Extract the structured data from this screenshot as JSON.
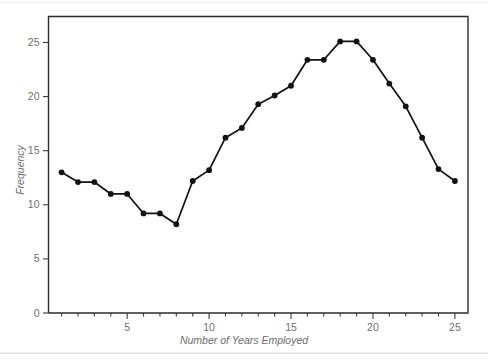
{
  "figure": {
    "background_color": "#ffffff",
    "frame_color": "#2b2b2b",
    "series_color": "#111111",
    "tick_label_color": "#6f6f6f",
    "axis_title_color": "#6b6b6b"
  },
  "axes": {
    "x_title": "Number of Years Employed",
    "y_title": "Frequency",
    "x_tick_labels": [
      "5",
      "10",
      "15",
      "20",
      "25"
    ],
    "x_tick_values": [
      5,
      10,
      15,
      20,
      25
    ],
    "y_tick_labels": [
      "0",
      "5",
      "10",
      "15",
      "20",
      "25"
    ],
    "y_tick_values": [
      0,
      5,
      10,
      15,
      20,
      25
    ],
    "x_minor_step": 1,
    "x_range": [
      0.2,
      25.8
    ],
    "y_range": [
      0,
      27.4
    ]
  },
  "chart_data": {
    "type": "line",
    "title": "",
    "xlabel": "Number of Years Employed",
    "ylabel": "Frequency",
    "xlim": [
      0.2,
      25.8
    ],
    "ylim": [
      0,
      27.4
    ],
    "grid": false,
    "legend": false,
    "markers": true,
    "x": [
      1,
      2,
      3,
      4,
      5,
      6,
      7,
      8,
      9,
      10,
      11,
      12,
      13,
      14,
      15,
      16,
      17,
      18,
      19,
      20,
      21,
      22,
      23,
      24,
      25
    ],
    "values": [
      13.0,
      12.1,
      12.1,
      11.0,
      11.0,
      9.2,
      9.2,
      8.2,
      12.2,
      13.2,
      16.2,
      17.1,
      19.3,
      20.1,
      21.0,
      23.4,
      23.4,
      25.1,
      25.1,
      23.4,
      21.2,
      19.1,
      16.2,
      13.3,
      12.2
    ],
    "series": [
      {
        "name": "Frequency",
        "x": [
          1,
          2,
          3,
          4,
          5,
          6,
          7,
          8,
          9,
          10,
          11,
          12,
          13,
          14,
          15,
          16,
          17,
          18,
          19,
          20,
          21,
          22,
          23,
          24,
          25
        ],
        "values": [
          13.0,
          12.1,
          12.1,
          11.0,
          11.0,
          9.2,
          9.2,
          8.2,
          12.2,
          13.2,
          16.2,
          17.1,
          19.3,
          20.1,
          21.0,
          23.4,
          23.4,
          25.1,
          25.1,
          23.4,
          21.2,
          19.1,
          16.2,
          13.3,
          12.2
        ]
      }
    ]
  }
}
